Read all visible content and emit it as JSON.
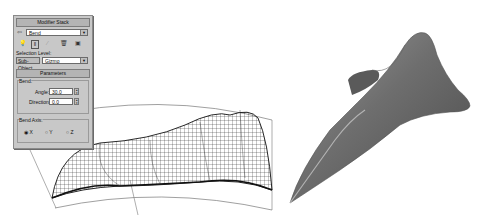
{
  "modifier_stack": {
    "title": "Modifier Stack",
    "selected_modifier": "Bend",
    "pin_icon": "pin-stack-icon",
    "toolbar_icons": [
      "active-inactive-toggle-icon",
      "show-end-result-icon",
      "make-unique-icon",
      "remove-modifier-icon",
      "configure-modifier-sets-icon"
    ],
    "selection_level_label": "Selection Level:",
    "sub_object_button": "Sub-Object",
    "sub_object_value": "Gizmo"
  },
  "parameters": {
    "title": "Parameters",
    "bend_group": "Bend:",
    "angle_label": "Angle:",
    "angle_value": "30.0",
    "direction_label": "Direction:",
    "direction_value": "0.0",
    "bend_axis_group": "Bend Axis:",
    "axis_options": [
      {
        "label": "X",
        "selected": true
      },
      {
        "label": "Y",
        "selected": false
      },
      {
        "label": "Z",
        "selected": false
      }
    ]
  },
  "viewport": {
    "wireframe_object": "bent-wireframe-mesh",
    "shaded_object": "smooth-shaded-bent-surface"
  }
}
